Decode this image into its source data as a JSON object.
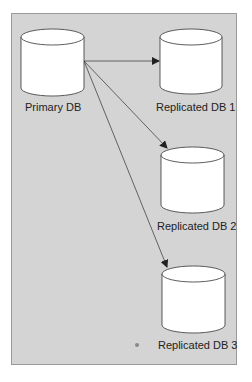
{
  "diagram": {
    "type": "database-replication",
    "nodes": [
      {
        "id": "primary",
        "label": "Primary DB"
      },
      {
        "id": "replica1",
        "label": "Replicated DB 1"
      },
      {
        "id": "replica2",
        "label": "Replicated DB 2"
      },
      {
        "id": "replica3",
        "label": "Replicated DB 3"
      }
    ],
    "edges": [
      {
        "from": "primary",
        "to": "replica1"
      },
      {
        "from": "primary",
        "to": "replica2"
      },
      {
        "from": "primary",
        "to": "replica3"
      }
    ],
    "colors": {
      "background": "#d4d4d4",
      "cylinder": "#ffffff",
      "stroke": "#333333"
    }
  }
}
